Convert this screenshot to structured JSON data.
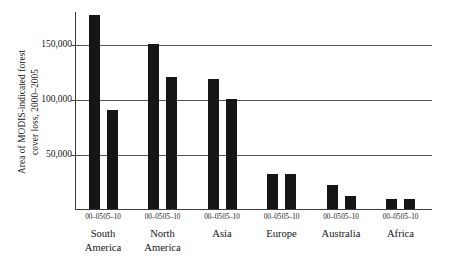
{
  "chart_data": {
    "type": "bar",
    "title": "",
    "xlabel": "",
    "ylabel_lines": [
      "Area of MODIS-indicated forest",
      "cover loss, 2000–2005"
    ],
    "ylabel": "Area of MODIS-indicated forest cover loss, 2000–2005",
    "ylim": [
      0,
      180000
    ],
    "yticks": [
      50000,
      100000,
      150000
    ],
    "ytick_labels": [
      "50,000",
      "100,000",
      "150,000"
    ],
    "grid": "horizontal",
    "legend": "none",
    "series": [
      {
        "name": "00–05",
        "values": [
          176000,
          150000,
          118000,
          32000,
          22000,
          9000
        ]
      },
      {
        "name": "05–10",
        "values": [
          90000,
          120000,
          100000,
          32000,
          12000,
          9000
        ]
      }
    ],
    "categories": [
      "South America",
      "North America",
      "Asia",
      "Europe",
      "Australia",
      "Africa"
    ],
    "category_label_lines": [
      [
        "South",
        "America"
      ],
      [
        "North",
        "America"
      ],
      [
        "Asia",
        ""
      ],
      [
        "Europe",
        ""
      ],
      [
        "Australia",
        ""
      ],
      [
        "Africa",
        ""
      ]
    ],
    "period_labels": [
      "00–05",
      "05–10"
    ],
    "bar_color": "#151515",
    "grid_color": "#555555",
    "axis_color": "#3b3b3b"
  }
}
